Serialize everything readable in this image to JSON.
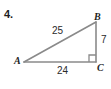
{
  "figure": {
    "problem_number": "4.",
    "type": "right-triangle-diagram",
    "stroke_color": "#8a8a8a",
    "text_color": "#1e1e1e",
    "background_color": "#ffffff"
  },
  "vertices": {
    "a": {
      "label": "A",
      "x": 24,
      "y": 62
    },
    "b": {
      "label": "B",
      "x": 96,
      "y": 22
    },
    "c": {
      "label": "C",
      "x": 96,
      "y": 62
    }
  },
  "sides": {
    "hypotenuse": {
      "name": "AB",
      "length_label": "25"
    },
    "vertical_leg": {
      "name": "BC",
      "length_label": "7"
    },
    "horizontal_leg": {
      "name": "AC",
      "length_label": "24"
    }
  },
  "markers": {
    "right_angle": {
      "at_vertex": "C",
      "name": "right-angle-mark"
    }
  }
}
